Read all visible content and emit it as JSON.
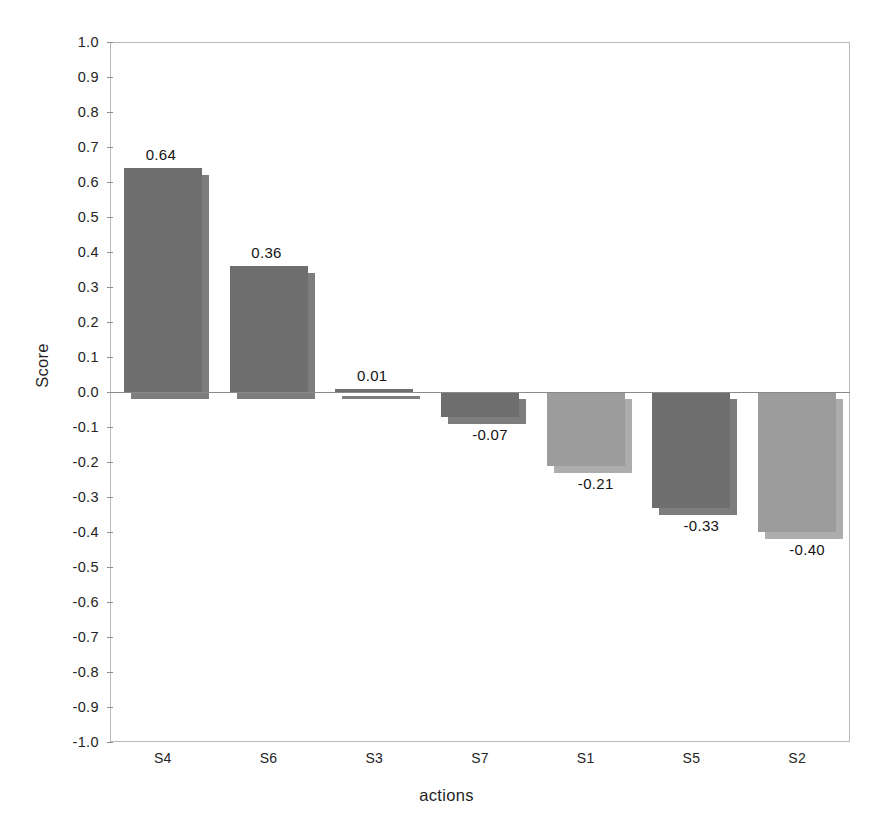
{
  "chart_data": {
    "type": "bar",
    "title": "",
    "xlabel": "actions",
    "ylabel": "Score",
    "categories": [
      "S4",
      "S6",
      "S3",
      "S7",
      "S1",
      "S5",
      "S2"
    ],
    "values": [
      0.64,
      0.36,
      0.01,
      -0.07,
      -0.21,
      -0.33,
      -0.4
    ],
    "data_labels": [
      "0.64",
      "0.36",
      "0.01",
      "-0.07",
      "-0.21",
      "-0.33",
      "-0.40"
    ],
    "bar_colors": [
      "#6e6e6e",
      "#6e6e6e",
      "#6e6e6e",
      "#6e6e6e",
      "#9c9c9c",
      "#6e6e6e",
      "#9c9c9c"
    ],
    "ylim": [
      -1.0,
      1.0
    ],
    "ytick_labels": [
      "1.0",
      "0.9",
      "0.8",
      "0.7",
      "0.6",
      "0.5",
      "0.4",
      "0.3",
      "0.2",
      "0.1",
      "0.0",
      "-0.1",
      "-0.2",
      "-0.3",
      "-0.4",
      "-0.5",
      "-0.6",
      "-0.7",
      "-0.8",
      "-0.9",
      "-1.0"
    ],
    "ytick_values": [
      1.0,
      0.9,
      0.8,
      0.7,
      0.6,
      0.5,
      0.4,
      0.3,
      0.2,
      0.1,
      0.0,
      -0.1,
      -0.2,
      -0.3,
      -0.4,
      -0.5,
      -0.6,
      -0.7,
      -0.8,
      -0.9,
      -1.0
    ],
    "grid": false,
    "legend": null,
    "zero_line": 0.0,
    "bar_style": "3d-offset-shadow",
    "background": "#ffffff",
    "axis_color": "#b9b9b9"
  }
}
